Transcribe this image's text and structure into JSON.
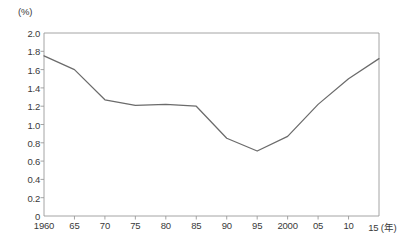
{
  "chart_data": {
    "type": "line",
    "title": "",
    "subtitle": "",
    "xlabel": "",
    "ylabel": "",
    "y_unit_label": "(%)",
    "x_unit_label": "(年)",
    "x_tick_labels": [
      "1960",
      "65",
      "70",
      "75",
      "80",
      "85",
      "90",
      "95",
      "2000",
      "05",
      "10",
      "15"
    ],
    "x": [
      1960,
      1965,
      1970,
      1975,
      1980,
      1985,
      1990,
      1995,
      2000,
      2005,
      2010,
      2015
    ],
    "values": [
      1.75,
      1.6,
      1.27,
      1.21,
      1.22,
      1.2,
      0.85,
      0.71,
      0.87,
      1.22,
      1.5,
      1.72
    ],
    "series": [
      {
        "name": "",
        "values": [
          1.75,
          1.6,
          1.27,
          1.21,
          1.22,
          1.2,
          0.85,
          0.71,
          0.87,
          1.22,
          1.5,
          1.72
        ]
      }
    ],
    "y_tick_labels": [
      "2.0",
      "1.8",
      "1.6",
      "1.4",
      "1.2",
      "1.0",
      "0.8",
      "0.6",
      "0.4",
      "0.2",
      "0"
    ],
    "y_ticks": [
      2.0,
      1.8,
      1.6,
      1.4,
      1.2,
      1.0,
      0.8,
      0.6,
      0.4,
      0.2,
      0
    ],
    "ylim": [
      0,
      2.0
    ],
    "xlim": [
      1960,
      2015
    ],
    "grid": false,
    "legend": false,
    "legend_position": "none",
    "line_color": "#6b6b6b",
    "axis_color": "#9a9a9a",
    "text_color": "#3a3a3a"
  }
}
